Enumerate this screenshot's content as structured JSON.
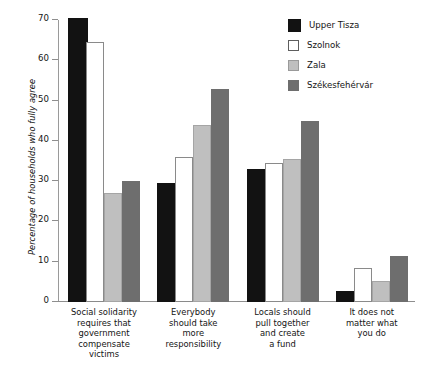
{
  "chart_data": {
    "type": "bar",
    "title": "",
    "subtitle": "",
    "xlabel": "",
    "ylabel": "Percentage of households who fully agree",
    "ylim": [
      0,
      70
    ],
    "yticks": [
      0,
      10,
      20,
      30,
      40,
      50,
      60,
      70
    ],
    "grid": false,
    "legend_position": "top-right",
    "categories": [
      "Social solidarity requires that government compensate victims",
      "Everybody should take more responsibility",
      "Locals should pull together and create a fund",
      "It does not matter what you do"
    ],
    "category_lines": [
      [
        "Social solidarity",
        "requires that",
        "government",
        "compensate",
        "victims"
      ],
      [
        "Everybody",
        "should take",
        "more",
        "responsibility"
      ],
      [
        "Locals should",
        "pull together",
        "and create",
        "a fund"
      ],
      [
        "It does not",
        "matter what",
        "you do"
      ]
    ],
    "series": [
      {
        "name": "Upper Tisza",
        "color": "#121212",
        "values": [
          70.0,
          29.0,
          32.5,
          2.3
        ]
      },
      {
        "name": "Szolnok",
        "color": "#ffffff",
        "values": [
          64.5,
          36.0,
          34.5,
          8.5
        ]
      },
      {
        "name": "Zala",
        "color": "#bfbfbf",
        "values": [
          27.0,
          44.0,
          35.5,
          5.3
        ]
      },
      {
        "name": "Székesfehérvár",
        "color": "#6e6e6e",
        "values": [
          30.0,
          53.0,
          45.0,
          11.3
        ]
      }
    ]
  },
  "legend": {
    "items": [
      {
        "label": "Upper Tisza"
      },
      {
        "label": "Szolnok"
      },
      {
        "label": "Zala"
      },
      {
        "label": "Székesfehérvár"
      }
    ]
  }
}
